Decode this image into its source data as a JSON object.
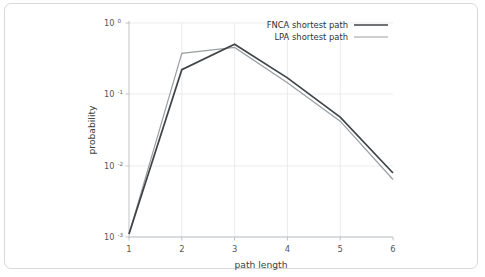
{
  "figure": {
    "frame_border_color": "#d8d8d8",
    "background_color": "#ffffff"
  },
  "chart_data": {
    "type": "line",
    "title": "",
    "subtitle": "",
    "xlabel": "path length",
    "ylabel": "probability",
    "x": [
      1,
      2,
      3,
      4,
      5,
      6
    ],
    "xlim": [
      1,
      6
    ],
    "ylim": [
      0.001,
      1.0
    ],
    "yscale": "log",
    "xscale": "linear",
    "grid": true,
    "legend_position": "top-right",
    "xtick_labels": [
      "1",
      "2",
      "3",
      "4",
      "5",
      "6"
    ],
    "ytick_labels": [
      "10⁻³",
      "10⁻²",
      "10⁻¹",
      "10⁰"
    ],
    "ytick_values": [
      0.001,
      0.01,
      0.1,
      1.0
    ],
    "ytick_base": "10",
    "ytick_exponents": [
      "-3",
      "-2",
      "-1",
      "0"
    ],
    "series": [
      {
        "name": "FNCA shortest path",
        "color": "#3f4447",
        "width": 1.7,
        "values": [
          0.0011,
          0.222,
          0.505,
          0.17,
          0.048,
          0.0079
        ]
      },
      {
        "name": "LPA shortest path",
        "color": "#9a9ea1",
        "width": 1.2,
        "values": [
          0.0011,
          0.375,
          0.455,
          0.145,
          0.042,
          0.0064
        ]
      }
    ]
  },
  "legend": {
    "entries": [
      {
        "label": "FNCA shortest path",
        "color": "#3f4447"
      },
      {
        "label": "LPA shortest path",
        "color": "#9a9ea1"
      }
    ]
  },
  "axes": {
    "x_title": "path length",
    "y_title": "probability"
  }
}
